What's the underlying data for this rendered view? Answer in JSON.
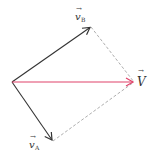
{
  "diagram": {
    "vectors": [
      {
        "id": "vB",
        "label": "v",
        "subscript": "B",
        "color": "#333333"
      },
      {
        "id": "vA",
        "label": "v",
        "subscript": "A",
        "color": "#333333"
      },
      {
        "id": "V",
        "label": "V",
        "subscript": "",
        "color": "#e0426a"
      }
    ],
    "construction_line_color": "#999999",
    "arrow_symbol": "→"
  }
}
